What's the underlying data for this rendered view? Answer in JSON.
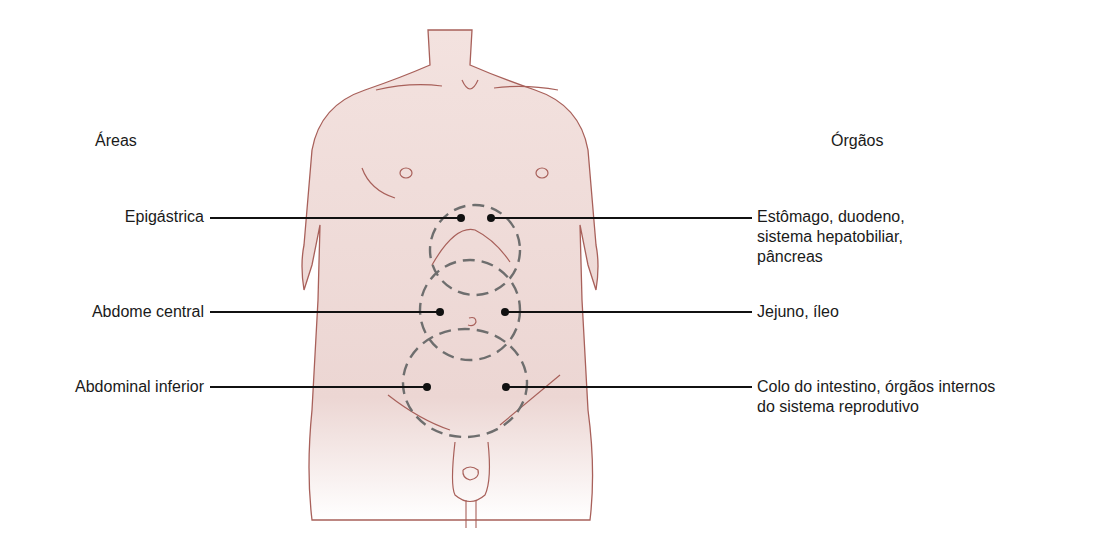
{
  "headers": {
    "left": "Áreas",
    "right": "Órgãos"
  },
  "areas": [
    {
      "label": "Epigástrica",
      "organs": [
        "Estômago, duodeno,",
        "sistema hepatobiliar,",
        "pâncreas"
      ]
    },
    {
      "label": "Abdome central",
      "organs": [
        "Jejuno, íleo"
      ]
    },
    {
      "label": "Abdominal inferior",
      "organs": [
        "Colo do intestino, órgãos internos",
        "do sistema reprodutivo"
      ]
    }
  ],
  "colors": {
    "skin": "#efd9d6",
    "outline": "#a8605a",
    "dash": "#6e6e6e",
    "leader": "#111111"
  }
}
